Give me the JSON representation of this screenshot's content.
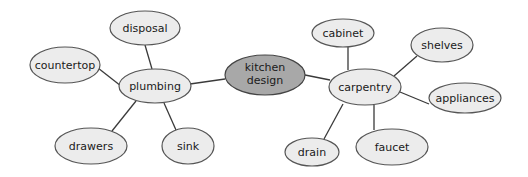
{
  "center": {
    "label_line1": "kitchen",
    "label_line2": "design"
  },
  "nodes": {
    "plumbing": "plumbing",
    "carpentry": "carpentry",
    "disposal": "disposal",
    "countertop": "countertop",
    "drawers": "drawers",
    "sink": "sink",
    "cabinet": "cabinet",
    "shelves": "shelves",
    "appliances": "appliances",
    "drain": "drain",
    "faucet": "faucet"
  },
  "colors": {
    "center_fill": "#a8a8a8",
    "node_fill": "#ececec",
    "stroke": "#555555"
  }
}
